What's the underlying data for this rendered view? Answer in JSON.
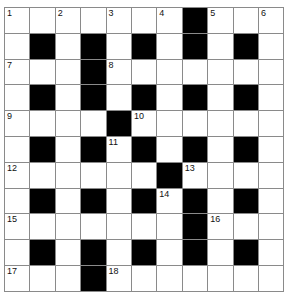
{
  "puzzle": {
    "rows": 11,
    "cols": 11,
    "layout": [
      "..........#...",
      "x"
    ],
    "grid": [
      [
        "1",
        "",
        "2",
        "",
        "3",
        "",
        "4",
        "#",
        "5",
        "",
        "6"
      ],
      [
        "",
        "#",
        "",
        "#",
        "",
        "#",
        "",
        "#",
        "",
        "#",
        ""
      ],
      [
        "7",
        "",
        "",
        "#",
        "8",
        "",
        "",
        "",
        "",
        "",
        ""
      ],
      [
        "",
        "#",
        "",
        "#",
        "",
        "#",
        "",
        "#",
        "",
        "#",
        ""
      ],
      [
        "9",
        "",
        "",
        "",
        "#",
        "10",
        "",
        "",
        "",
        "",
        ""
      ],
      [
        "",
        "#",
        "",
        "#",
        "11",
        "#",
        "",
        "#",
        "",
        "#",
        ""
      ],
      [
        "12",
        "",
        "",
        "",
        "",
        "",
        "#",
        "13",
        "",
        "",
        ""
      ],
      [
        "",
        "#",
        "",
        "#",
        "",
        "#",
        "14",
        "#",
        "",
        "#",
        ""
      ],
      [
        "15",
        "",
        "",
        "",
        "",
        "",
        "",
        "#",
        "16",
        "",
        ""
      ],
      [
        "",
        "#",
        "",
        "#",
        "",
        "#",
        "",
        "#",
        "",
        "#",
        ""
      ],
      [
        "17",
        "",
        "",
        "#",
        "18",
        "",
        "",
        "",
        "",
        "",
        ""
      ]
    ],
    "colors": {
      "block": "#000000",
      "cell": "#ffffff",
      "gridline": "#8a8a8a"
    }
  }
}
